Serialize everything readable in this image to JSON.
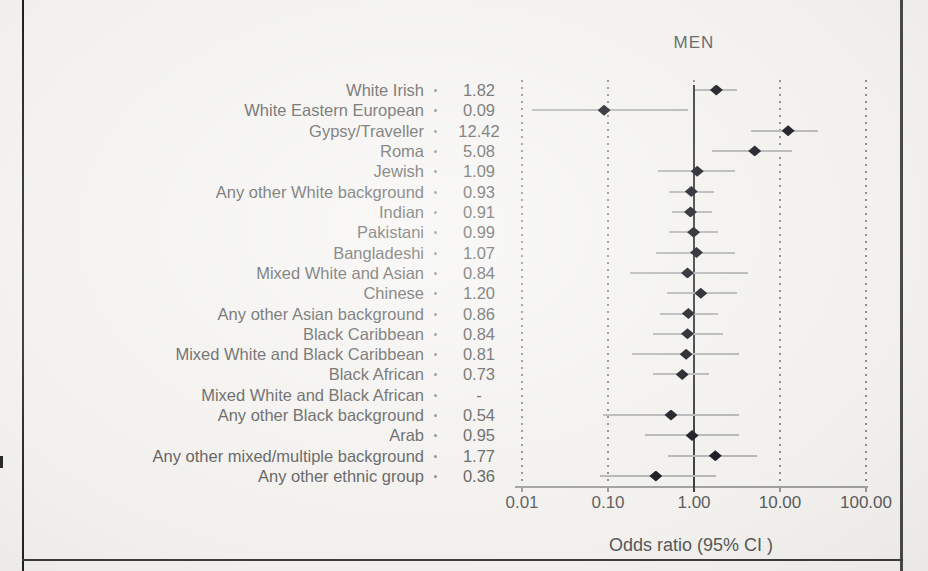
{
  "page": {
    "background_color": "#f6f5f2",
    "frame_color_left": "#2b2b2b",
    "frame_color_right": "#4a4a4a",
    "frame_color_bottom": "#3d3d3d"
  },
  "chart_data": {
    "type": "scatter",
    "variant": "forest-plot",
    "title": "MEN",
    "xlabel": "Odds ratio (95% CI )",
    "x_scale": "log",
    "xlim": [
      0.01,
      100
    ],
    "x_tick_values": [
      0.01,
      0.1,
      1,
      10,
      100
    ],
    "x_tick_labels": [
      "0.01",
      "0.10",
      "1.00",
      "10.00",
      "100.00"
    ],
    "reference_line_x": 1.0,
    "grid": "dotted-vertical",
    "legend": "none",
    "categories": [
      "White Irish",
      "White Eastern European",
      "Gypsy/Traveller",
      "Roma",
      "Jewish",
      "Any other White background",
      "Indian",
      "Pakistani",
      "Bangladeshi",
      "Mixed White and Asian",
      "Chinese",
      "Any other Asian background",
      "Black Caribbean",
      "Mixed White and Black Caribbean",
      "Black African",
      "Mixed White and Black African",
      "Any other Black background",
      "Arab",
      "Any other mixed/multiple background",
      "Any other ethnic group"
    ],
    "or_labels": [
      "1.82",
      "0.09",
      "12.42",
      "5.08",
      "1.09",
      "0.93",
      "0.91",
      "0.99",
      "1.07",
      "0.84",
      "1.20",
      "0.86",
      "0.84",
      "0.81",
      "0.73",
      "-",
      "0.54",
      "0.95",
      "1.77",
      "0.36"
    ],
    "series": [
      {
        "name": "Odds ratio (95% CI)",
        "or": [
          1.82,
          0.09,
          12.42,
          5.08,
          1.09,
          0.93,
          0.91,
          0.99,
          1.07,
          0.84,
          1.2,
          0.86,
          0.84,
          0.81,
          0.73,
          null,
          0.54,
          0.95,
          1.77,
          0.36
        ],
        "ci_low_est": [
          1.03,
          0.013,
          4.6,
          1.6,
          0.38,
          0.51,
          0.55,
          0.51,
          0.36,
          0.18,
          0.49,
          0.4,
          0.33,
          0.19,
          0.33,
          null,
          0.088,
          0.27,
          0.5,
          0.081
        ],
        "ci_high_est": [
          3.2,
          0.85,
          27.7,
          13.8,
          3.0,
          1.7,
          1.6,
          1.9,
          3.0,
          4.2,
          3.2,
          1.9,
          2.2,
          3.3,
          1.5,
          null,
          3.3,
          3.3,
          5.4,
          1.8
        ]
      }
    ],
    "colors": {
      "marker": "#17171f",
      "ci_line": "#b9b9b9",
      "gridline": "#8f8f8f",
      "reference_line": "#3b3b42",
      "axis": "#a3a3a3",
      "text": "#5d5d5d"
    }
  }
}
